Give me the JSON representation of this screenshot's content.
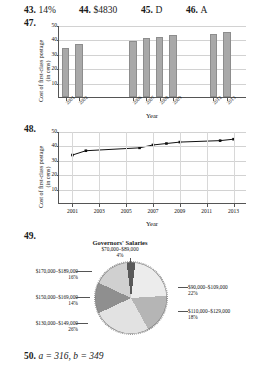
{
  "page": {
    "top_cutoff_text": "",
    "answers_row": [
      {
        "number": "43.",
        "value": "14%"
      },
      {
        "number": "44.",
        "value": "$4830"
      },
      {
        "number": "45.",
        "value": "D"
      },
      {
        "number": "46.",
        "value": "A"
      }
    ],
    "exercise_47_label": "47.",
    "exercise_48_label": "48.",
    "exercise_49_label": "49.",
    "answer_50": {
      "number": "50.",
      "value": "a = 316, b = 349"
    }
  },
  "chart_data": [
    {
      "id": "bar-chart-47",
      "type": "bar",
      "title": "",
      "xlabel": "Year",
      "ylabel": "Cost of first-class postage (in cens)",
      "categories": [
        "2001",
        "2002",
        "2006",
        "2007",
        "2008",
        "2009",
        "2012",
        "2013"
      ],
      "values": [
        34,
        37,
        39,
        41,
        42,
        43,
        44,
        45
      ],
      "ylim": [
        0,
        50
      ],
      "yticks": [
        "10",
        "20",
        "30",
        "40",
        "50"
      ],
      "ytick_values": [
        10,
        20,
        30,
        40,
        50
      ],
      "grid": true,
      "legend": "none"
    },
    {
      "id": "line-chart-48",
      "type": "line",
      "title": "",
      "xlabel": "Year",
      "ylabel": "Cost of first-class postage (in cens)",
      "x": [
        2001,
        2002,
        2006,
        2007,
        2008,
        2009,
        2012,
        2013
      ],
      "values": [
        34,
        37,
        39,
        41,
        42,
        43,
        44,
        45
      ],
      "ylim": [
        0,
        50
      ],
      "xlim": [
        2000,
        2014
      ],
      "yticks": [
        "10",
        "20",
        "30",
        "40",
        "50"
      ],
      "ytick_values": [
        10,
        20,
        30,
        40,
        50
      ],
      "xticks": [
        "2001",
        "2003",
        "2005",
        "2007",
        "2009",
        "2011",
        "2013"
      ],
      "xtick_values": [
        2001,
        2003,
        2005,
        2007,
        2009,
        2011,
        2013
      ],
      "grid": true,
      "legend": "none"
    },
    {
      "id": "pie-chart-49",
      "type": "pie",
      "title": "Governors' Salaries",
      "labels": [
        "$70,000–$89,000",
        "$90,000–$109,000",
        "$110,000–$129,000",
        "$130,000–$149,000",
        "$150,000–$169,000",
        "$170,000–$189,000"
      ],
      "values": [
        4,
        22,
        18,
        26,
        14,
        16
      ],
      "percent_labels": [
        "4%",
        "22%",
        "18%",
        "26%",
        "14%",
        "16%"
      ],
      "legend": "callout-labels"
    }
  ]
}
